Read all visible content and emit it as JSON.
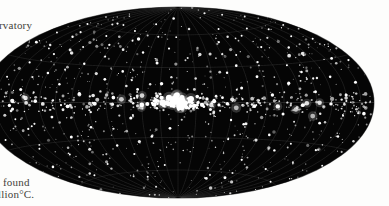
{
  "page": {
    "background_color": "#ffffff",
    "text_color": "#2a2722"
  },
  "text_fragments": {
    "top_left": "rvatory",
    "bottom_left_line1": "found",
    "bottom_left_line2": "llion°C."
  },
  "figure": {
    "name": "all-sky-map",
    "projection": "aitoff",
    "background_color": "#050505",
    "source_marker_color": "#ffffff",
    "graticule_color": "#3e3e3e"
  },
  "chart_data": {
    "type": "scatter",
    "title": "",
    "subtitle": "",
    "xlabel": "",
    "ylabel": "",
    "projection": "aitoff",
    "grid": true,
    "legend": null,
    "xlim": [
      -180,
      180
    ],
    "ylim": [
      -90,
      90
    ],
    "graticule": {
      "meridian_step_deg": 30,
      "parallel_step_deg": 30,
      "meridians": [
        -150,
        -120,
        -90,
        -60,
        -30,
        0,
        30,
        60,
        90,
        120,
        150
      ],
      "parallels": [
        -60,
        -30,
        0,
        30,
        60
      ]
    },
    "series": [
      {
        "name": "sources",
        "marker": "circle",
        "color": "#ffffff",
        "points": [
          [
            -176,
            2,
            1.2
          ],
          [
            -171,
            -24,
            1.0
          ],
          [
            -168,
            41,
            1.4
          ],
          [
            -164,
            -9,
            1.1
          ],
          [
            -160,
            17,
            1.0
          ],
          [
            -157,
            -46,
            1.3
          ],
          [
            -154,
            60,
            1.0
          ],
          [
            -150,
            -2,
            1.6
          ],
          [
            -147,
            28,
            1.1
          ],
          [
            -143,
            -33,
            1.0
          ],
          [
            -140,
            9,
            1.5
          ],
          [
            -137,
            50,
            1.2
          ],
          [
            -133,
            -17,
            1.0
          ],
          [
            -130,
            36,
            1.1
          ],
          [
            -127,
            -58,
            1.0
          ],
          [
            -124,
            1,
            1.8
          ],
          [
            -120,
            22,
            1.3
          ],
          [
            -117,
            -40,
            1.0
          ],
          [
            -114,
            66,
            1.1
          ],
          [
            -110,
            -11,
            1.4
          ],
          [
            -107,
            44,
            1.0
          ],
          [
            -104,
            14,
            1.2
          ],
          [
            -100,
            -27,
            1.5
          ],
          [
            -97,
            55,
            1.0
          ],
          [
            -94,
            -3,
            1.9
          ],
          [
            -90,
            31,
            1.2
          ],
          [
            -87,
            -51,
            1.0
          ],
          [
            -84,
            7,
            1.6
          ],
          [
            -80,
            48,
            1.1
          ],
          [
            -77,
            -20,
            1.3
          ],
          [
            -74,
            38,
            1.0
          ],
          [
            -70,
            -1,
            2.1
          ],
          [
            -67,
            62,
            1.0
          ],
          [
            -64,
            19,
            1.4
          ],
          [
            -60,
            -36,
            1.2
          ],
          [
            -57,
            53,
            1.0
          ],
          [
            -54,
            4,
            1.8
          ],
          [
            -50,
            26,
            1.3
          ],
          [
            -47,
            -44,
            1.1
          ],
          [
            -44,
            70,
            1.0
          ],
          [
            -40,
            -13,
            1.6
          ],
          [
            -37,
            43,
            1.2
          ],
          [
            -34,
            11,
            1.4
          ],
          [
            -30,
            -2,
            2.3
          ],
          [
            -27,
            58,
            1.0
          ],
          [
            -24,
            -29,
            1.3
          ],
          [
            -20,
            34,
            1.5
          ],
          [
            -17,
            -55,
            1.0
          ],
          [
            -14,
            16,
            1.7
          ],
          [
            -10,
            47,
            1.1
          ],
          [
            -7,
            -22,
            1.4
          ],
          [
            -4,
            0,
            2.6
          ],
          [
            -2,
            3,
            2.2
          ],
          [
            2,
            -1,
            2.8
          ],
          [
            4,
            2,
            2.4
          ],
          [
            7,
            -4,
            2.0
          ],
          [
            10,
            1,
            2.5
          ],
          [
            13,
            -3,
            1.9
          ],
          [
            16,
            5,
            1.8
          ],
          [
            20,
            -2,
            2.2
          ],
          [
            24,
            3,
            1.7
          ],
          [
            27,
            -6,
            1.5
          ],
          [
            30,
            1,
            2.0
          ],
          [
            34,
            -2,
            1.6
          ],
          [
            37,
            4,
            1.4
          ],
          [
            41,
            -1,
            1.8
          ],
          [
            44,
            25,
            1.2
          ],
          [
            47,
            -31,
            1.0
          ],
          [
            50,
            52,
            1.1
          ],
          [
            54,
            12,
            1.5
          ],
          [
            57,
            -18,
            1.3
          ],
          [
            60,
            40,
            1.0
          ],
          [
            64,
            -3,
            1.9
          ],
          [
            67,
            64,
            1.0
          ],
          [
            70,
            21,
            1.4
          ],
          [
            74,
            -48,
            1.1
          ],
          [
            77,
            33,
            1.2
          ],
          [
            80,
            6,
            1.7
          ],
          [
            84,
            -26,
            1.3
          ],
          [
            87,
            56,
            1.0
          ],
          [
            90,
            -9,
            1.5
          ],
          [
            94,
            45,
            1.1
          ],
          [
            97,
            15,
            1.6
          ],
          [
            100,
            -38,
            1.2
          ],
          [
            104,
            29,
            1.0
          ],
          [
            107,
            -2,
            1.9
          ],
          [
            110,
            61,
            1.0
          ],
          [
            114,
            23,
            1.3
          ],
          [
            117,
            -53,
            1.1
          ],
          [
            120,
            8,
            1.5
          ],
          [
            124,
            42,
            1.2
          ],
          [
            127,
            -15,
            1.4
          ],
          [
            130,
            35,
            1.0
          ],
          [
            134,
            -1,
            1.7
          ],
          [
            137,
            57,
            1.0
          ],
          [
            140,
            18,
            1.3
          ],
          [
            144,
            -34,
            1.1
          ],
          [
            147,
            49,
            1.0
          ],
          [
            150,
            5,
            1.6
          ],
          [
            154,
            -23,
            1.2
          ],
          [
            157,
            30,
            1.4
          ],
          [
            160,
            -60,
            1.0
          ],
          [
            164,
            13,
            1.5
          ],
          [
            167,
            44,
            1.0
          ],
          [
            170,
            -7,
            1.8
          ],
          [
            174,
            27,
            1.1
          ],
          [
            177,
            -42,
            1.0
          ]
        ]
      }
    ],
    "annotations": []
  }
}
